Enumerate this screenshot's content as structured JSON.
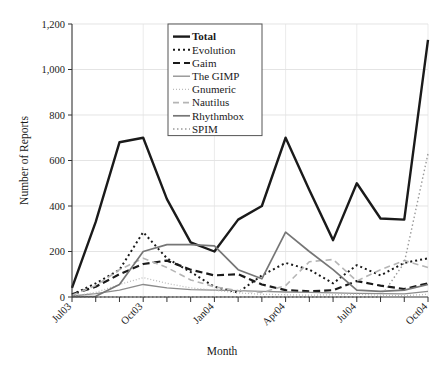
{
  "chart_data": {
    "type": "line",
    "title": "",
    "xlabel": "Month",
    "ylabel": "Number of Reports",
    "ylim": [
      0,
      1200
    ],
    "yticks": [
      0,
      200,
      400,
      600,
      800,
      1000,
      1200
    ],
    "ytick_labels": [
      "0",
      "200",
      "400",
      "600",
      "800",
      "1,000",
      "1,200"
    ],
    "grid": true,
    "legend_position": "top-center",
    "x": [
      "Jul03",
      "Aug03",
      "Sep03",
      "Oct03",
      "Nov03",
      "Dec03",
      "Jan04",
      "Feb04",
      "Mar04",
      "Apr04",
      "May04",
      "Jun04",
      "Jul04",
      "Aug04",
      "Sep04",
      "Oct04"
    ],
    "xtick_labels": [
      "Jul03",
      "",
      "",
      "Oct03",
      "",
      "",
      "Jan04",
      "",
      "",
      "Apr04",
      "",
      "",
      "Jul04",
      "",
      "",
      "Oct04"
    ],
    "xtick_labels_visible": [
      "Jul03",
      "Oct03",
      "Jan04",
      "Apr04",
      "Jul04",
      "Oct04"
    ],
    "series": [
      {
        "name": "Total",
        "color": "#1a1a1a",
        "width": 2.4,
        "dash": "none",
        "bold": true,
        "values": [
          40,
          330,
          680,
          700,
          430,
          240,
          200,
          340,
          400,
          700,
          470,
          250,
          500,
          345,
          340,
          1130
        ]
      },
      {
        "name": "Evolution",
        "color": "#1a1a1a",
        "width": 2.0,
        "dash": "2,3",
        "values": [
          10,
          60,
          120,
          285,
          170,
          110,
          45,
          20,
          95,
          150,
          120,
          60,
          140,
          95,
          150,
          170
        ]
      },
      {
        "name": "Gaim",
        "color": "#1a1a1a",
        "width": 2.2,
        "dash": "7,4",
        "values": [
          12,
          45,
          100,
          145,
          160,
          120,
          95,
          100,
          55,
          30,
          25,
          30,
          70,
          50,
          35,
          60
        ]
      },
      {
        "name": "The GIMP",
        "color": "#8c8c8c",
        "width": 1.3,
        "dash": "none",
        "values": [
          5,
          15,
          30,
          55,
          40,
          32,
          30,
          28,
          25,
          22,
          20,
          18,
          16,
          15,
          14,
          25
        ]
      },
      {
        "name": "Gnumeric",
        "color": "#bcbcbc",
        "width": 1.3,
        "dash": "1,2",
        "values": [
          4,
          20,
          55,
          85,
          60,
          40,
          30,
          18,
          12,
          10,
          8,
          10,
          12,
          8,
          6,
          12
        ]
      },
      {
        "name": "Nautilus",
        "color": "#b5b5b5",
        "width": 1.6,
        "dash": "6,4",
        "values": [
          8,
          50,
          120,
          170,
          130,
          75,
          45,
          28,
          20,
          50,
          155,
          165,
          70,
          120,
          160,
          130
        ]
      },
      {
        "name": "Rhythmbox",
        "color": "#767676",
        "width": 1.7,
        "dash": "none",
        "values": [
          2,
          3,
          55,
          200,
          230,
          230,
          225,
          120,
          80,
          285,
          200,
          120,
          30,
          25,
          30,
          55
        ]
      },
      {
        "name": "SPIM",
        "color": "#9a9a9a",
        "width": 1.4,
        "dash": "1.5,2.5",
        "values": [
          0,
          0,
          0,
          0,
          0,
          0,
          0,
          0,
          0,
          0,
          0,
          0,
          0,
          0,
          150,
          630
        ]
      }
    ]
  },
  "legend": {
    "items": [
      {
        "label": "Total"
      },
      {
        "label": "Evolution"
      },
      {
        "label": "Gaim"
      },
      {
        "label": "The GIMP"
      },
      {
        "label": "Gnumeric"
      },
      {
        "label": "Nautilus"
      },
      {
        "label": "Rhythmbox"
      },
      {
        "label": "SPIM"
      }
    ]
  }
}
